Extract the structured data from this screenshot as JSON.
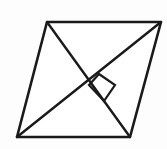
{
  "figure": {
    "shape_name": "parallelogram",
    "background_color": "#fdfdfd",
    "stroke_color": "#1a1a1a",
    "fill_color": "#ffffff",
    "canvas": {
      "width": 167,
      "height": 149
    },
    "vertices": [
      {
        "label": "top-left",
        "x": 47,
        "y": 22
      },
      {
        "label": "top-right",
        "x": 161,
        "y": 22
      },
      {
        "label": "bottom-right",
        "x": 130,
        "y": 137
      },
      {
        "label": "bottom-left",
        "x": 17,
        "y": 137
      }
    ],
    "outline_points": "47,22 161,22 130,137 17,137",
    "edges": [
      {
        "name": "top-edge",
        "from": "47,22",
        "to": "161,22"
      },
      {
        "name": "right-edge",
        "from": "161,22",
        "to": "130,137"
      },
      {
        "name": "bottom-edge",
        "from": "130,137",
        "to": "17,137"
      },
      {
        "name": "left-edge",
        "from": "17,137",
        "to": "47,22"
      }
    ],
    "diagonals": [
      {
        "name": "diagonal-tl-br",
        "x1": 47,
        "y1": 22,
        "x2": 130,
        "y2": 137
      },
      {
        "name": "diagonal-tr-bl",
        "x1": 161,
        "y1": 22,
        "x2": 17,
        "y2": 137
      }
    ],
    "intersection": {
      "x": 89,
      "y": 85
    },
    "right_angle_marker": {
      "present": true,
      "points": "99,74 115,85 104,101 89,85",
      "size": 20
    }
  }
}
